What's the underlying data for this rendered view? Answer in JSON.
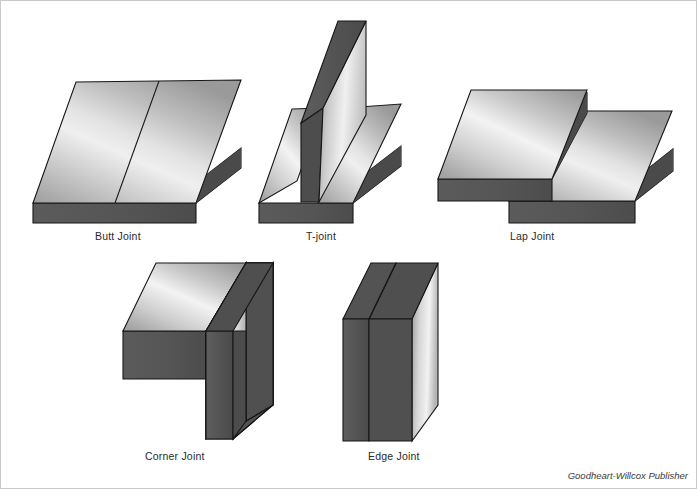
{
  "figure": {
    "background_color": "#ffffff",
    "border_color": "#c9c9c9",
    "credit": "Goodheart-Willcox Publisher"
  },
  "palette": {
    "edge_dark": "#565656",
    "edge_dark_2": "#4e4e4e",
    "outline": "#1a1a1a",
    "metal_light": "#f2f2f2",
    "metal_mid": "#b9b9b9",
    "metal_dark": "#8f8f8f",
    "label_color": "#2a2a2a"
  },
  "joints": [
    {
      "id": "butt-joint",
      "label": "Butt Joint",
      "description": "Two flat plates meeting edge to edge in the same plane"
    },
    {
      "id": "t-joint",
      "label": "T-joint",
      "description": "Vertical plate standing perpendicular on a horizontal base plate"
    },
    {
      "id": "lap-joint",
      "label": "Lap Joint",
      "description": "Two plates overlapping one another"
    },
    {
      "id": "corner-joint",
      "label": "Corner Joint",
      "description": "Two plates meeting at a right angle forming an L corner"
    },
    {
      "id": "edge-joint",
      "label": "Edge Joint",
      "description": "Two plates placed face to face with edges aligned"
    }
  ]
}
